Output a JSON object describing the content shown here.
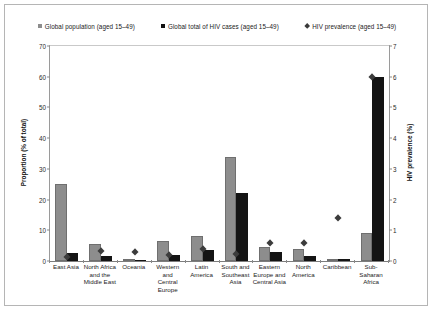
{
  "legend": {
    "items": [
      {
        "label": "Global population (aged 15–49)",
        "marker": "square-gray-icon",
        "color": "#8d8d8d"
      },
      {
        "label": "Global total of HIV cases (aged 15–49)",
        "marker": "square-black-icon",
        "color": "#141414"
      },
      {
        "label": "HIV prevalence (aged 15–49)",
        "marker": "diamond-icon",
        "color": "#3c3c3c"
      }
    ]
  },
  "axes": {
    "left_title": "Proportion (% of total)",
    "right_title": "HIV prevalence (%)",
    "left_ticks": [
      "0",
      "10",
      "20",
      "30",
      "40",
      "50",
      "60",
      "70"
    ],
    "right_ticks": [
      "0",
      "1",
      "2",
      "3",
      "4",
      "5",
      "6",
      "7"
    ]
  },
  "chart_data": {
    "type": "bar",
    "title": "",
    "xlabel": "",
    "ylabel": "Proportion (% of total)",
    "y2label": "HIV prevalence (%)",
    "ylim": [
      0,
      70
    ],
    "y2lim": [
      0,
      7
    ],
    "grid": false,
    "legend_position": "top-center",
    "categories": [
      "East Asia",
      "North Africa and the Middle East",
      "Oceania",
      "Western and Central Europe",
      "Latin America",
      "South and Southeast Asia",
      "Eastern Europe and Central Asia",
      "North America",
      "Caribbean",
      "Sub-Saharan Africa"
    ],
    "category_lines": [
      [
        "East Asia"
      ],
      [
        "North Africa",
        "and the",
        "Middle East"
      ],
      [
        "Oceania"
      ],
      [
        "Western and",
        "Central",
        "Europe"
      ],
      [
        "Latin",
        "America"
      ],
      [
        "South and",
        "Southeast",
        "Asia"
      ],
      [
        "Eastern",
        "Europe and",
        "Central Asia"
      ],
      [
        "North",
        "America"
      ],
      [
        "Caribbean"
      ],
      [
        "Sub-Saharan",
        "Africa"
      ]
    ],
    "series": [
      {
        "name": "Global population (aged 15–49)",
        "axis": "left",
        "type": "bar",
        "color": "#8d8d8d",
        "values": [
          25.0,
          5.5,
          0.5,
          6.5,
          8.0,
          34.0,
          4.5,
          4.0,
          0.7,
          9.0
        ]
      },
      {
        "name": "Global total of HIV cases (aged 15–49)",
        "axis": "left",
        "type": "bar",
        "color": "#141414",
        "values": [
          2.5,
          1.5,
          0.4,
          2.0,
          3.5,
          22.0,
          3.0,
          1.5,
          0.8,
          60.0
        ]
      },
      {
        "name": "HIV prevalence (aged 15–49)",
        "axis": "right",
        "type": "marker",
        "color": "#3c3c3c",
        "values": [
          0.15,
          0.35,
          0.3,
          0.2,
          0.4,
          0.25,
          0.6,
          0.6,
          1.4,
          6.0
        ]
      }
    ]
  }
}
